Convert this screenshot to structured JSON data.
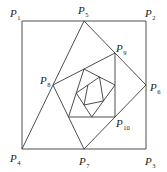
{
  "figure": {
    "colors": {
      "stroke": "#3a3a3a",
      "text": "#222222",
      "background": "#ffffff"
    },
    "square": {
      "P1": [
        22,
        21
      ],
      "P2": [
        146,
        21
      ],
      "P3": [
        146,
        149
      ],
      "P4": [
        22,
        149
      ]
    },
    "spiral_points": [
      [
        22,
        149
      ],
      [
        84,
        21
      ],
      [
        146,
        85
      ],
      [
        84,
        149
      ],
      [
        53,
        85
      ],
      [
        115,
        53
      ],
      [
        115,
        117
      ],
      [
        68.5,
        117
      ],
      [
        84,
        69
      ],
      [
        115,
        85
      ],
      [
        91.75,
        117
      ],
      [
        76.25,
        93
      ],
      [
        99.5,
        77
      ],
      [
        103.4,
        101
      ],
      [
        84,
        105
      ],
      [
        87.9,
        85
      ]
    ],
    "labels": [
      {
        "id": "P1",
        "letter": "P",
        "sub": "1",
        "x": 10,
        "y": 17
      },
      {
        "id": "P5",
        "letter": "P",
        "sub": "5",
        "x": 78,
        "y": 14
      },
      {
        "id": "P2",
        "letter": "P",
        "sub": "2",
        "x": 145,
        "y": 17
      },
      {
        "id": "P9",
        "letter": "P",
        "sub": "9",
        "x": 116,
        "y": 52
      },
      {
        "id": "P8",
        "letter": "P",
        "sub": "8",
        "x": 40,
        "y": 84
      },
      {
        "id": "P6",
        "letter": "P",
        "sub": "6",
        "x": 150,
        "y": 91
      },
      {
        "id": "P10",
        "letter": "P",
        "sub": "10",
        "x": 116,
        "y": 127
      },
      {
        "id": "P4",
        "letter": "P",
        "sub": "4",
        "x": 10,
        "y": 162
      },
      {
        "id": "P7",
        "letter": "P",
        "sub": "7",
        "x": 79,
        "y": 165
      },
      {
        "id": "P3",
        "letter": "P",
        "sub": "3",
        "x": 145,
        "y": 165
      }
    ]
  }
}
